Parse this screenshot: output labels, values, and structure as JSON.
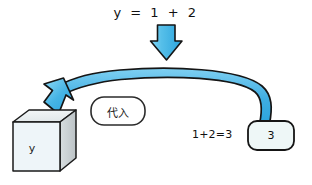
{
  "diagram": {
    "equation": "y = 1 + 2",
    "substitute_label": "代入",
    "cube_label": "y",
    "sum_text": "1+2=3",
    "result_value": "3",
    "icons": {
      "down_arrow": "down-arrow-icon",
      "curved_arrow": "curved-left-arrow-icon",
      "cube": "cube-icon"
    },
    "colors": {
      "arrow_fill": "#3aaee0",
      "arrow_fill_light": "#7fd2f2",
      "arrow_stroke": "#1a1a1a",
      "cube_front": "#eef5f8",
      "cube_top": "#e8ecee",
      "cube_side": "#c9cfd2",
      "box_fill": "#eef7f7",
      "box_stroke": "#1a1a1a",
      "text": "#111111",
      "background": "#ffffff"
    }
  }
}
